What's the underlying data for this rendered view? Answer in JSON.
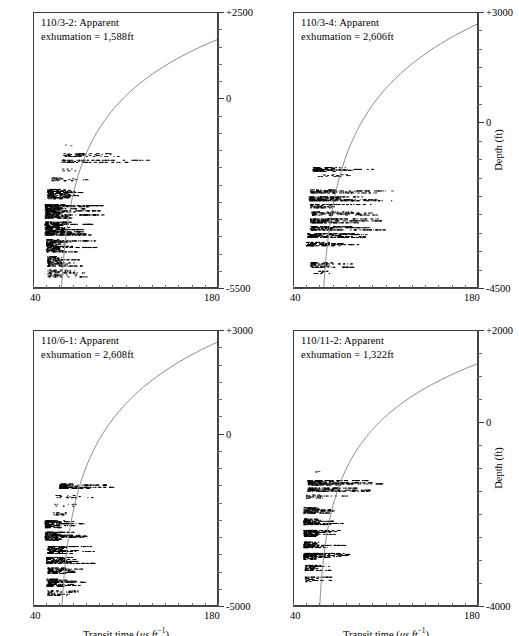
{
  "figure": {
    "axis_titles": {
      "x_prefix": "Transit time (",
      "x_mu": "μs ft",
      "x_exp": "−1",
      "x_suffix": ")",
      "x_full": "Transit time (μs ft−1)",
      "y": "Depth (ft)"
    },
    "x_axis": {
      "min_label": "40",
      "max_label": "180",
      "min": 40,
      "max": 180,
      "minor_ticks": 14
    },
    "colors": {
      "data_points": "#000000",
      "trend_curve": "#8c8c8c",
      "axis": "#3c3c3c",
      "tick": "#6a6a6a",
      "background": "#ffffff"
    }
  },
  "panels": [
    {
      "id": "panel-110-3-2",
      "position": "top-left",
      "well": "110/3-2",
      "title_line1": "110/3-2: Apparent",
      "title_line2": "exhumation = 1,588ft",
      "exhumation_ft": 1588,
      "show_y_axis_title": false,
      "show_x_axis_title": false,
      "depth_axis": {
        "top_label": "+2500",
        "bottom_label": "-5500",
        "zero_label": "0",
        "top": 2500,
        "bottom": -5500,
        "zero": 0,
        "minor_interval": 500
      },
      "curve": {
        "top_y": 1750,
        "knee_frac": 0.62,
        "bottom_x": 58
      },
      "clusters": [
        {
          "depth": -1350,
          "thickness": 70,
          "t_lo": 63,
          "t_hi": 78,
          "density": 0.22
        },
        {
          "depth": -1620,
          "thickness": 110,
          "t_lo": 62,
          "t_hi": 104,
          "density": 0.55
        },
        {
          "depth": -1800,
          "thickness": 90,
          "t_lo": 60,
          "t_hi": 132,
          "density": 0.6
        },
        {
          "depth": -2050,
          "thickness": 80,
          "t_lo": 61,
          "t_hi": 78,
          "density": 0.35
        },
        {
          "depth": -2320,
          "thickness": 110,
          "t_lo": 53,
          "t_hi": 86,
          "density": 0.5
        },
        {
          "depth": -2750,
          "thickness": 300,
          "t_lo": 50,
          "t_hi": 92,
          "density": 0.95
        },
        {
          "depth": -3250,
          "thickness": 420,
          "t_lo": 48,
          "t_hi": 95,
          "density": 1.0
        },
        {
          "depth": -3750,
          "thickness": 400,
          "t_lo": 48,
          "t_hi": 90,
          "density": 0.98
        },
        {
          "depth": -4250,
          "thickness": 380,
          "t_lo": 49,
          "t_hi": 88,
          "density": 0.92
        },
        {
          "depth": -4700,
          "thickness": 300,
          "t_lo": 50,
          "t_hi": 86,
          "density": 0.8
        },
        {
          "depth": -5050,
          "thickness": 230,
          "t_lo": 50,
          "t_hi": 84,
          "density": 0.55
        }
      ]
    },
    {
      "id": "panel-110-3-4",
      "position": "top-right",
      "well": "110/3-4",
      "title_line1": "110/3-4: Apparent",
      "title_line2": "exhumation = 2,606ft",
      "exhumation_ft": 2606,
      "show_y_axis_title": true,
      "show_x_axis_title": false,
      "depth_axis": {
        "top_label": "+3000",
        "bottom_label": "-4500",
        "zero_label": "0",
        "top": 3000,
        "bottom": -4500,
        "zero": 0,
        "minor_interval": 500
      },
      "curve": {
        "top_y": 2720,
        "knee_frac": 0.66,
        "bottom_x": 59
      },
      "clusters": [
        {
          "depth": -1250,
          "thickness": 130,
          "t_lo": 54,
          "t_hi": 104,
          "density": 0.8
        },
        {
          "depth": -1420,
          "thickness": 70,
          "t_lo": 58,
          "t_hi": 98,
          "density": 0.45
        },
        {
          "depth": -1850,
          "thickness": 110,
          "t_lo": 52,
          "t_hi": 126,
          "density": 0.7
        },
        {
          "depth": -2050,
          "thickness": 130,
          "t_lo": 51,
          "t_hi": 132,
          "density": 0.85
        },
        {
          "depth": -2250,
          "thickness": 120,
          "t_lo": 52,
          "t_hi": 112,
          "density": 0.7
        },
        {
          "depth": -2450,
          "thickness": 110,
          "t_lo": 53,
          "t_hi": 118,
          "density": 0.65
        },
        {
          "depth": -2650,
          "thickness": 130,
          "t_lo": 52,
          "t_hi": 114,
          "density": 0.88
        },
        {
          "depth": -2850,
          "thickness": 120,
          "t_lo": 52,
          "t_hi": 120,
          "density": 0.8
        },
        {
          "depth": -3050,
          "thickness": 130,
          "t_lo": 50,
          "t_hi": 122,
          "density": 0.9
        },
        {
          "depth": -3280,
          "thickness": 120,
          "t_lo": 49,
          "t_hi": 116,
          "density": 0.78
        },
        {
          "depth": -3850,
          "thickness": 150,
          "t_lo": 52,
          "t_hi": 100,
          "density": 0.72
        },
        {
          "depth": -4050,
          "thickness": 90,
          "t_lo": 54,
          "t_hi": 82,
          "density": 0.45
        }
      ]
    },
    {
      "id": "panel-110-6-1",
      "position": "bottom-left",
      "well": "110/6-1",
      "title_line1": "110/6-1: Apparent",
      "title_line2": "exhumation = 2,608ft",
      "exhumation_ft": 2608,
      "show_y_axis_title": false,
      "show_x_axis_title": true,
      "depth_axis": {
        "top_label": "+3000",
        "bottom_label": "-5000",
        "zero_label": "0",
        "top": 3000,
        "bottom": -5000,
        "zero": 0,
        "minor_interval": 500
      },
      "curve": {
        "top_y": 2700,
        "knee_frac": 0.64,
        "bottom_x": 58
      },
      "clusters": [
        {
          "depth": -1500,
          "thickness": 160,
          "t_lo": 59,
          "t_hi": 100,
          "density": 0.92
        },
        {
          "depth": -1800,
          "thickness": 90,
          "t_lo": 56,
          "t_hi": 98,
          "density": 0.48
        },
        {
          "depth": -2050,
          "thickness": 80,
          "t_lo": 55,
          "t_hi": 76,
          "density": 0.3
        },
        {
          "depth": -2300,
          "thickness": 90,
          "t_lo": 54,
          "t_hi": 84,
          "density": 0.45
        },
        {
          "depth": -2600,
          "thickness": 230,
          "t_lo": 48,
          "t_hi": 86,
          "density": 0.95
        },
        {
          "depth": -2950,
          "thickness": 260,
          "t_lo": 48,
          "t_hi": 82,
          "density": 0.98
        },
        {
          "depth": -3350,
          "thickness": 230,
          "t_lo": 50,
          "t_hi": 92,
          "density": 0.9
        },
        {
          "depth": -3650,
          "thickness": 200,
          "t_lo": 49,
          "t_hi": 96,
          "density": 0.88
        },
        {
          "depth": -3950,
          "thickness": 190,
          "t_lo": 50,
          "t_hi": 86,
          "density": 0.82
        },
        {
          "depth": -4300,
          "thickness": 240,
          "t_lo": 49,
          "t_hi": 80,
          "density": 0.9
        },
        {
          "depth": -4600,
          "thickness": 160,
          "t_lo": 50,
          "t_hi": 74,
          "density": 0.6
        }
      ]
    },
    {
      "id": "panel-110-11-2",
      "position": "bottom-right",
      "well": "110/11-2",
      "title_line1": "110/11-2: Apparent",
      "title_line2": "exhumation = 1,322ft",
      "exhumation_ft": 1322,
      "show_y_axis_title": true,
      "show_x_axis_title": true,
      "depth_axis": {
        "top_label": "+2000",
        "bottom_label": "-4000",
        "zero_label": "0",
        "top": 2000,
        "bottom": -4000,
        "zero": 0,
        "minor_interval": 500
      },
      "curve": {
        "top_y": 1300,
        "knee_frac": 0.6,
        "bottom_x": 57
      },
      "clusters": [
        {
          "depth": -1050,
          "thickness": 50,
          "t_lo": 56,
          "t_hi": 64,
          "density": 0.2
        },
        {
          "depth": -1300,
          "thickness": 120,
          "t_lo": 50,
          "t_hi": 108,
          "density": 0.85
        },
        {
          "depth": -1450,
          "thickness": 90,
          "t_lo": 50,
          "t_hi": 110,
          "density": 0.8
        },
        {
          "depth": -1600,
          "thickness": 90,
          "t_lo": 49,
          "t_hi": 86,
          "density": 0.55
        },
        {
          "depth": -1900,
          "thickness": 140,
          "t_lo": 47,
          "t_hi": 82,
          "density": 0.92
        },
        {
          "depth": -2150,
          "thickness": 140,
          "t_lo": 47,
          "t_hi": 86,
          "density": 0.95
        },
        {
          "depth": -2400,
          "thickness": 150,
          "t_lo": 47,
          "t_hi": 88,
          "density": 0.96
        },
        {
          "depth": -2650,
          "thickness": 140,
          "t_lo": 47,
          "t_hi": 84,
          "density": 0.92
        },
        {
          "depth": -2900,
          "thickness": 150,
          "t_lo": 47,
          "t_hi": 86,
          "density": 0.94
        },
        {
          "depth": -3150,
          "thickness": 130,
          "t_lo": 48,
          "t_hi": 78,
          "density": 0.8
        },
        {
          "depth": -3400,
          "thickness": 120,
          "t_lo": 48,
          "t_hi": 70,
          "density": 0.62
        }
      ]
    }
  ],
  "chart_data": {
    "type": "scatter",
    "xlabel": "Transit time (μs ft−1)",
    "ylabel": "Depth (ft)",
    "xlim": [
      40,
      180
    ],
    "grid": false,
    "legend": "none",
    "panel_count": 4,
    "series": [
      {
        "name": "110/3-2",
        "annotation": "110/3-2: Apparent exhumation = 1,588ft",
        "ylim": [
          -5500,
          2500
        ],
        "apparent_exhumation_ft": 1588,
        "normal_compaction_curve": {
          "surface_transit_time": 180,
          "intercept_depth_ft": 1750
        },
        "data_envelope": {
          "depth_range_ft": [
            -5200,
            -1300
          ],
          "transit_time_range_us_ft": [
            48,
            132
          ]
        }
      },
      {
        "name": "110/3-4",
        "annotation": "110/3-4: Apparent exhumation = 2,606ft",
        "ylim": [
          -4500,
          3000
        ],
        "apparent_exhumation_ft": 2606,
        "normal_compaction_curve": {
          "surface_transit_time": 180,
          "intercept_depth_ft": 2720
        },
        "data_envelope": {
          "depth_range_ft": [
            -4100,
            -1200
          ],
          "transit_time_range_us_ft": [
            49,
            132
          ]
        }
      },
      {
        "name": "110/6-1",
        "annotation": "110/6-1: Apparent exhumation = 2,608ft",
        "ylim": [
          -5000,
          3000
        ],
        "apparent_exhumation_ft": 2608,
        "normal_compaction_curve": {
          "surface_transit_time": 180,
          "intercept_depth_ft": 2700
        },
        "data_envelope": {
          "depth_range_ft": [
            -4700,
            -1450
          ],
          "transit_time_range_us_ft": [
            48,
            100
          ]
        }
      },
      {
        "name": "110/11-2",
        "annotation": "110/11-2: Apparent exhumation = 1,322ft",
        "ylim": [
          -4000,
          2000
        ],
        "apparent_exhumation_ft": 1322,
        "normal_compaction_curve": {
          "surface_transit_time": 180,
          "intercept_depth_ft": 1300
        },
        "data_envelope": {
          "depth_range_ft": [
            -3500,
            -1050
          ],
          "transit_time_range_us_ft": [
            47,
            110
          ]
        }
      }
    ]
  }
}
